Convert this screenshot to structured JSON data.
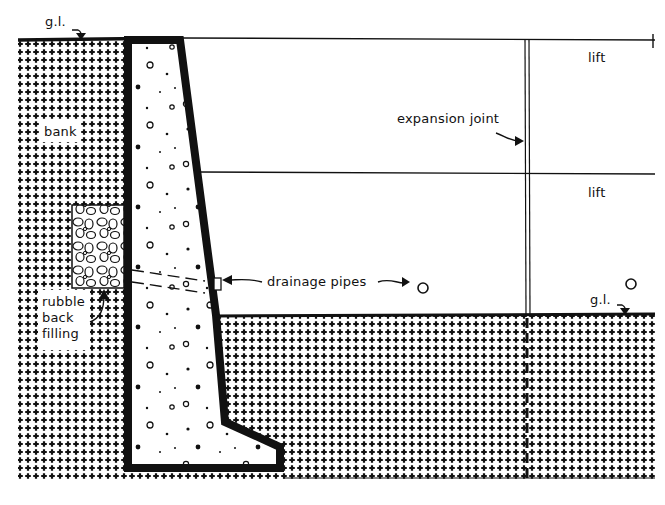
{
  "diagram": {
    "type": "retaining-wall-section",
    "colors": {
      "ink": "#111111",
      "paper": "#ffffff"
    },
    "labels": {
      "gl_top": "g.l.",
      "gl_right": "g.l.",
      "lift_upper": "lift",
      "lift_lower": "lift",
      "expansion_joint": "expansion joint",
      "bank": "bank",
      "drainage_pipes": "drainage  pipes",
      "rubble_line1": "rubble",
      "rubble_line2": "back",
      "rubble_line3": "filling"
    },
    "legend_symbols": {
      "pipe_marker_1": "circle",
      "pipe_marker_2": "circle"
    }
  }
}
